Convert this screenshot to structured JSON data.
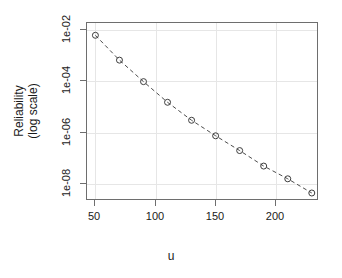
{
  "chart_data": {
    "type": "scatter",
    "title": "",
    "xlabel": "u",
    "ylabel_lines": [
      "Reliability",
      "(log scale)"
    ],
    "ylabel": "Reliability (log scale)",
    "yscale": "log",
    "xscale": "linear",
    "grid": true,
    "legend": null,
    "marker": "open-circle",
    "line_style": "dashed",
    "xlim": [
      43,
      236
    ],
    "ylim": [
      2.2e-09,
      0.018
    ],
    "xticks": [
      50,
      100,
      150,
      200
    ],
    "xticklabels": [
      "50",
      "100",
      "150",
      "200"
    ],
    "yticks": [
      0.01,
      0.0001,
      1e-06,
      1e-08
    ],
    "yticklabels": [
      "1e-02",
      "1e-04",
      "1e-06",
      "1e-08"
    ],
    "x": [
      50,
      70,
      90,
      110,
      130,
      150,
      170,
      190,
      210,
      230
    ],
    "y": [
      0.006,
      0.00065,
      9.5e-05,
      1.5e-05,
      3e-06,
      7.5e-07,
      2e-07,
      5e-08,
      1.6e-08,
      4.5e-09
    ],
    "points": [
      {
        "u": 50,
        "reliability": 0.006
      },
      {
        "u": 70,
        "reliability": 0.00065
      },
      {
        "u": 90,
        "reliability": 9.5e-05
      },
      {
        "u": 110,
        "reliability": 1.5e-05
      },
      {
        "u": 130,
        "reliability": 3e-06
      },
      {
        "u": 150,
        "reliability": 7.5e-07
      },
      {
        "u": 170,
        "reliability": 2e-07
      },
      {
        "u": 190,
        "reliability": 5e-08
      },
      {
        "u": 210,
        "reliability": 1.6e-08
      },
      {
        "u": 230,
        "reliability": 4.5e-09
      }
    ],
    "colors": {
      "marker": "#3d3d3d",
      "line": "#4d4d4d",
      "axis": "#6e6e6e",
      "grid": "#e6e6e6",
      "text": "#1a1a1a",
      "background": "#ffffff"
    }
  }
}
